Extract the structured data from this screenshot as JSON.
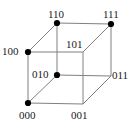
{
  "figure": {
    "name": "binary-cube",
    "width": 130,
    "height": 131,
    "background_color": "#ffffff",
    "edge_color": "#808080",
    "vertex_dot_color": "#000000",
    "label_color": "#1a1a1a"
  },
  "chart_data": {
    "type": "diagram",
    "title": "",
    "subtitle": "",
    "xlabel": "",
    "ylabel": "",
    "grid": false,
    "legend": "none",
    "nodes": [
      {
        "id": "110",
        "label": "110",
        "x": 57,
        "y": 23,
        "dot": true,
        "label_x": 48,
        "label_y": 9,
        "label_anchor": "above"
      },
      {
        "id": "111",
        "label": "111",
        "x": 111,
        "y": 24,
        "dot": true,
        "label_x": 103,
        "label_y": 9,
        "label_anchor": "above"
      },
      {
        "id": "100",
        "label": "100",
        "x": 28,
        "y": 52,
        "dot": true,
        "label_x": 2,
        "label_y": 46,
        "label_anchor": "left"
      },
      {
        "id": "101",
        "label": "101",
        "x": 83,
        "y": 52,
        "dot": false,
        "label_x": 66,
        "label_y": 39,
        "label_anchor": "above-left"
      },
      {
        "id": "010",
        "label": "010",
        "x": 57,
        "y": 75,
        "dot": true,
        "label_x": 32,
        "label_y": 69,
        "label_anchor": "left"
      },
      {
        "id": "011",
        "label": "011",
        "x": 111,
        "y": 76,
        "dot": false,
        "label_x": 112,
        "label_y": 70,
        "label_anchor": "right"
      },
      {
        "id": "000",
        "label": "000",
        "x": 28,
        "y": 103,
        "dot": true,
        "label_x": 19,
        "label_y": 110,
        "label_anchor": "below"
      },
      {
        "id": "001",
        "label": "001",
        "x": 83,
        "y": 104,
        "dot": false,
        "label_x": 71,
        "label_y": 110,
        "label_anchor": "below"
      }
    ],
    "edges": [
      {
        "from": "110",
        "to": "111"
      },
      {
        "from": "110",
        "to": "100"
      },
      {
        "from": "110",
        "to": "010"
      },
      {
        "from": "111",
        "to": "101"
      },
      {
        "from": "111",
        "to": "011"
      },
      {
        "from": "100",
        "to": "101"
      },
      {
        "from": "100",
        "to": "000"
      },
      {
        "from": "010",
        "to": "011"
      },
      {
        "from": "010",
        "to": "000"
      },
      {
        "from": "101",
        "to": "001"
      },
      {
        "from": "011",
        "to": "001"
      },
      {
        "from": "000",
        "to": "001"
      }
    ]
  }
}
